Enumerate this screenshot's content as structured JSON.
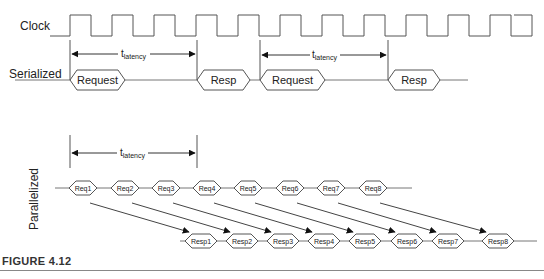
{
  "labels": {
    "clock": "Clock",
    "serialized": "Serialized",
    "parallelized": "Parallelized",
    "latency_main": "t",
    "latency_sub": "latency"
  },
  "serialized": {
    "transactions": [
      {
        "label": "Request",
        "x1": 70,
        "x2": 125
      },
      {
        "label": "Resp",
        "x1": 197,
        "x2": 250
      },
      {
        "label": "Request",
        "x1": 260,
        "x2": 325
      },
      {
        "label": "Resp",
        "x1": 388,
        "x2": 440
      }
    ]
  },
  "parallelized": {
    "requests": [
      "Req1",
      "Req2",
      "Req3",
      "Req4",
      "Req5",
      "Req6",
      "Req7",
      "Req8"
    ],
    "responses": [
      "Resp1",
      "Resp2",
      "Resp3",
      "Resp4",
      "Resp5",
      "Resp6",
      "Resp7",
      "Resp8"
    ]
  },
  "caption": "FIGURE 4.12",
  "colors": {
    "line": "#555555",
    "text": "#222222",
    "arrow": "#111111"
  }
}
